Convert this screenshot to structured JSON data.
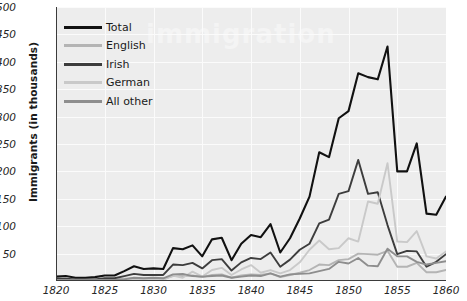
{
  "chart_data": {
    "type": "line",
    "title": "",
    "xlabel": "",
    "ylabel": "Immigrants (in thousands)",
    "xlim": [
      1820,
      1860
    ],
    "ylim": [
      0,
      500
    ],
    "xticks": [
      1820,
      1825,
      1830,
      1835,
      1840,
      1845,
      1850,
      1855,
      1860
    ],
    "yticks": [
      50,
      100,
      150,
      200,
      250,
      300,
      350,
      400,
      450,
      500
    ],
    "grid": true,
    "legend_position": "top-left",
    "x": [
      1820,
      1821,
      1822,
      1823,
      1824,
      1825,
      1826,
      1827,
      1828,
      1829,
      1830,
      1831,
      1832,
      1833,
      1834,
      1835,
      1836,
      1837,
      1838,
      1839,
      1840,
      1841,
      1842,
      1843,
      1844,
      1845,
      1846,
      1847,
      1848,
      1849,
      1850,
      1851,
      1852,
      1853,
      1854,
      1855,
      1856,
      1857,
      1858,
      1859,
      1860
    ],
    "series": [
      {
        "name": "Total",
        "color": "#111111",
        "values": [
          8,
          9,
          6,
          6,
          7,
          10,
          10,
          18,
          27,
          22,
          23,
          22,
          60,
          58,
          65,
          45,
          76,
          79,
          38,
          68,
          84,
          80,
          104,
          52,
          78,
          114,
          154,
          235,
          226,
          297,
          310,
          379,
          372,
          368,
          428,
          200,
          200,
          251,
          123,
          121,
          154
        ]
      },
      {
        "name": "English",
        "color": "#b4b4b4",
        "values": [
          2,
          2,
          2,
          2,
          2,
          3,
          3,
          4,
          5,
          4,
          4,
          4,
          9,
          9,
          10,
          7,
          11,
          12,
          6,
          10,
          12,
          11,
          14,
          7,
          11,
          15,
          20,
          30,
          29,
          38,
          40,
          50,
          49,
          48,
          55,
          26,
          26,
          33,
          16,
          16,
          20
        ]
      },
      {
        "name": "Irish",
        "color": "#3d3d3d",
        "values": [
          4,
          4,
          3,
          3,
          3,
          5,
          5,
          9,
          13,
          11,
          11,
          11,
          30,
          29,
          33,
          23,
          38,
          40,
          19,
          34,
          42,
          40,
          52,
          26,
          39,
          57,
          68,
          105,
          112,
          159,
          164,
          221,
          159,
          162,
          102,
          49,
          55,
          54,
          26,
          35,
          49
        ]
      },
      {
        "name": "German",
        "color": "#c9c9c9",
        "values": [
          1,
          1,
          1,
          1,
          1,
          1,
          1,
          2,
          3,
          2,
          2,
          2,
          10,
          6,
          17,
          8,
          20,
          24,
          11,
          21,
          29,
          15,
          20,
          14,
          20,
          34,
          57,
          74,
          58,
          60,
          78,
          72,
          145,
          141,
          215,
          72,
          71,
          91,
          45,
          41,
          54
        ]
      },
      {
        "name": "All other",
        "color": "#8e8e8e",
        "values": [
          1,
          2,
          1,
          1,
          1,
          2,
          2,
          3,
          6,
          5,
          6,
          5,
          12,
          13,
          9,
          8,
          9,
          10,
          6,
          8,
          10,
          9,
          14,
          8,
          12,
          13,
          14,
          18,
          22,
          35,
          32,
          42,
          28,
          27,
          59,
          45,
          45,
          35,
          30,
          33,
          36
        ]
      }
    ]
  },
  "legend": {
    "items": [
      {
        "label": "Total",
        "color": "#111111"
      },
      {
        "label": "English",
        "color": "#b4b4b4"
      },
      {
        "label": "Irish",
        "color": "#3d3d3d"
      },
      {
        "label": "German",
        "color": "#c9c9c9"
      },
      {
        "label": "All other",
        "color": "#8e8e8e"
      }
    ]
  },
  "axes": {
    "y_title": "Immigrants (in thousands)"
  },
  "watermark": {
    "text": "immigration"
  }
}
